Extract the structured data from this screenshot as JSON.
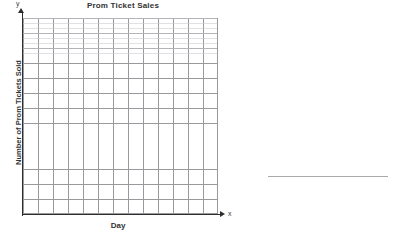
{
  "worksheet": {
    "title": "Prom Ticket Sales"
  },
  "chart_data": {
    "type": "grid",
    "title": "Prom Ticket Sales",
    "xlabel": "Day",
    "ylabel": "Number of Prom Tickets Sold",
    "x_axis_variable": "x",
    "y_axis_variable": "y",
    "grid": true,
    "grid_major_columns": 13,
    "grid_major_rows": 13,
    "grid_minor_per_major": 3,
    "categories": [],
    "values": [],
    "series": [],
    "tick_labels_x": [],
    "tick_labels_y": [],
    "legend": [],
    "annotations": [],
    "note": "Blank coordinate grid with no plotted data points",
    "colors": {
      "axis": "#2e2e2e",
      "grid_major": "#9a9a9e",
      "grid_minor": "#c8c8cd",
      "text": "#333333",
      "answer_line": "#a9a9ad",
      "background": "#ffffff"
    }
  },
  "answer": {
    "blank_line": ""
  }
}
